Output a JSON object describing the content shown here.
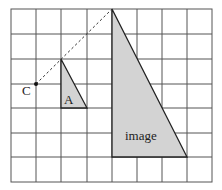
{
  "diagram": {
    "type": "enlargement-on-grid",
    "grid": {
      "cols": 8,
      "rows": 7,
      "line_color": "#555555"
    },
    "labels": {
      "center": "C",
      "object": "A",
      "image": "image"
    },
    "shape_fill": "#d3d3d3",
    "points": {
      "C": [
        1,
        3
      ],
      "A": [
        [
          2,
          2
        ],
        [
          2,
          4
        ],
        [
          3,
          4
        ]
      ],
      "image": [
        [
          4,
          0
        ],
        [
          4,
          6
        ],
        [
          7,
          6
        ]
      ]
    }
  }
}
